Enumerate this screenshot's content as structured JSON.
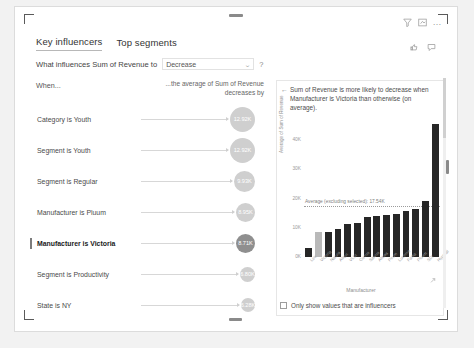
{
  "visual": {
    "tabs": [
      {
        "label": "Key influencers",
        "active": true
      },
      {
        "label": "Top segments",
        "active": false
      }
    ],
    "actions": {
      "filter_icon": "filter-icon",
      "focus_icon": "focus-mode-icon",
      "more_icon": "…",
      "like_icon": "thumbs-up-icon",
      "comment_icon": "comment-icon"
    },
    "question": {
      "label": "What influences Sum of Revenue to",
      "selected_value": "Decrease",
      "options": [
        "Increase",
        "Decrease"
      ],
      "chevron": "⌄",
      "help": "?"
    }
  },
  "left_pane": {
    "header_when": "When...",
    "header_average": "...the average of Sum of Revenue decreases by",
    "influencers": [
      {
        "label": "Category is Youth",
        "value": "12.92K",
        "size": 25,
        "selected": false
      },
      {
        "label": "Segment is Youth",
        "value": "12.92K",
        "size": 25,
        "selected": false
      },
      {
        "label": "Segment is Regular",
        "value": "9.93K",
        "size": 21,
        "selected": false
      },
      {
        "label": "Manufacturer is Pluum",
        "value": "8.95K",
        "size": 19,
        "selected": false
      },
      {
        "label": "Manufacturer is Victoria",
        "value": "8.71K",
        "size": 19,
        "selected": true
      },
      {
        "label": "Segment is Productivity",
        "value": "6.80K",
        "size": 15,
        "selected": false
      },
      {
        "label": "State is NY",
        "value": "6.28K",
        "size": 14,
        "selected": false
      }
    ]
  },
  "right_pane": {
    "back_icon": "←",
    "title": "Sum of Revenue is more likely to decrease when Manufacturer is Victoria than otherwise (on average).",
    "expand_icon": "expand-icon",
    "checkbox": {
      "checked": false,
      "label": "Only show values that are influencers"
    }
  },
  "chart_data": {
    "type": "bar",
    "title": "",
    "xlabel": "Manufacturer",
    "ylabel": "Average of Sum of Revenue",
    "ylim": [
      0,
      50000
    ],
    "yticks": [
      0,
      10000,
      20000,
      30000,
      40000
    ],
    "ytick_labels": [
      "0K",
      "10K",
      "20K",
      "30K",
      "40K"
    ],
    "grid": false,
    "legend": "none",
    "categories": [
      "Leo",
      "Victoria",
      "Natura",
      "Aliqui",
      "VLSI",
      "Currus",
      "Salvus",
      "Abbas",
      "Pirum",
      "Lucerne",
      "Fama",
      "Pluum",
      "SDI",
      "Hyperal"
    ],
    "values": [
      3100,
      8710,
      8500,
      9700,
      11200,
      11600,
      13800,
      14100,
      14500,
      14900,
      15600,
      16300,
      19200,
      45600
    ],
    "highlight_index": 1,
    "highlight_color": "#b9b9b9",
    "bar_color": "#262626",
    "reference_line": {
      "label": "Average (excluding selected): 17.54K",
      "value": 17540,
      "style": "dotted",
      "color": "#9b9b9b"
    }
  }
}
